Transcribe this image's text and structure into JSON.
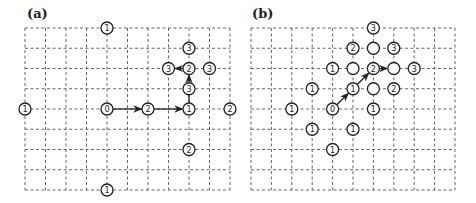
{
  "figure": {
    "panels": [
      {
        "id": "a",
        "label": "(a)",
        "grid": {
          "cols": 10,
          "rows": 8
        },
        "nodes": [
          {
            "col": 4,
            "row": 0,
            "label": "1"
          },
          {
            "col": 8,
            "row": 1,
            "label": "3"
          },
          {
            "col": 7,
            "row": 2,
            "label": "3"
          },
          {
            "col": 8,
            "row": 2,
            "label": "2"
          },
          {
            "col": 9,
            "row": 2,
            "label": "3"
          },
          {
            "col": 8,
            "row": 3,
            "label": "3"
          },
          {
            "col": 0,
            "row": 4,
            "label": "1"
          },
          {
            "col": 4,
            "row": 4,
            "label": "0"
          },
          {
            "col": 6,
            "row": 4,
            "label": "2"
          },
          {
            "col": 8,
            "row": 4,
            "label": "1"
          },
          {
            "col": 10,
            "row": 4,
            "label": "2"
          },
          {
            "col": 8,
            "row": 6,
            "label": "2"
          },
          {
            "col": 4,
            "row": 8,
            "label": "1"
          }
        ],
        "arrows": [
          {
            "from": [
              4,
              4
            ],
            "to": [
              6,
              4
            ]
          },
          {
            "from": [
              6,
              4
            ],
            "to": [
              8,
              4
            ]
          },
          {
            "from": [
              8,
              4
            ],
            "to": [
              8,
              2
            ],
            "via": [
              8,
              3
            ]
          },
          {
            "from": [
              8,
              2
            ],
            "to": [
              7,
              2
            ]
          }
        ]
      },
      {
        "id": "b",
        "label": "(b)",
        "grid": {
          "cols": 10,
          "rows": 8
        },
        "nodes": [
          {
            "col": 6,
            "row": 0,
            "label": "3"
          },
          {
            "col": 5,
            "row": 1,
            "label": "2"
          },
          {
            "col": 6,
            "row": 1,
            "label": ""
          },
          {
            "col": 7,
            "row": 1,
            "label": "3"
          },
          {
            "col": 4,
            "row": 2,
            "label": "1"
          },
          {
            "col": 5,
            "row": 2,
            "label": ""
          },
          {
            "col": 6,
            "row": 2,
            "label": "2"
          },
          {
            "col": 7,
            "row": 2,
            "label": ""
          },
          {
            "col": 8,
            "row": 2,
            "label": "3"
          },
          {
            "col": 3,
            "row": 3,
            "label": "1"
          },
          {
            "col": 5,
            "row": 3,
            "label": "1"
          },
          {
            "col": 6,
            "row": 3,
            "label": ""
          },
          {
            "col": 7,
            "row": 3,
            "label": "2"
          },
          {
            "col": 2,
            "row": 4,
            "label": "1"
          },
          {
            "col": 4,
            "row": 4,
            "label": "0"
          },
          {
            "col": 6,
            "row": 4,
            "label": "1"
          },
          {
            "col": 3,
            "row": 5,
            "label": "1"
          },
          {
            "col": 5,
            "row": 5,
            "label": "1"
          },
          {
            "col": 4,
            "row": 6,
            "label": "1"
          }
        ],
        "arrows": [
          {
            "from": [
              4,
              4
            ],
            "to": [
              5,
              3
            ]
          },
          {
            "from": [
              5,
              3
            ],
            "to": [
              6,
              2
            ]
          },
          {
            "from": [
              6,
              2
            ],
            "to": [
              7,
              2
            ]
          }
        ]
      }
    ]
  }
}
